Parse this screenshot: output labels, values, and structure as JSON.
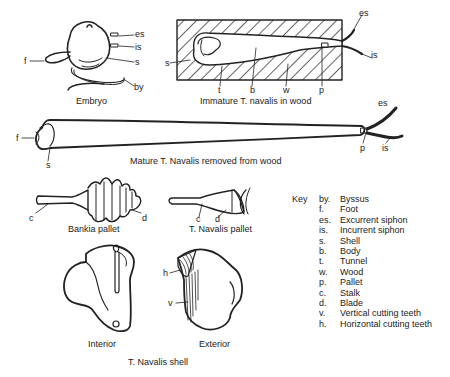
{
  "figures": {
    "embryo": {
      "caption": "Embryo",
      "labels": {
        "es": "es",
        "is": "is",
        "f": "f",
        "s": "s",
        "by": "by"
      }
    },
    "immature": {
      "caption": "Immature T. navalis in wood",
      "labels": {
        "es": "es",
        "is": "is",
        "s": "s",
        "t": "t",
        "b": "b",
        "w": "w",
        "p": "p"
      }
    },
    "mature": {
      "caption": "Mature T. Navalis removed from wood",
      "labels": {
        "es": "es",
        "f": "f",
        "s": "s",
        "p": "p",
        "is": "is"
      }
    },
    "bankia_pallet": {
      "caption": "Bankia pallet",
      "labels": {
        "c": "c",
        "d": "d"
      }
    },
    "navalis_pallet": {
      "caption": "T. Navalis pallet",
      "labels": {
        "c": "c",
        "d": "d"
      }
    },
    "shell": {
      "caption": "T. Navalis shell",
      "interior_caption": "Interior",
      "exterior_caption": "Exterior",
      "labels": {
        "h": "h",
        "v": "v"
      }
    }
  },
  "key": {
    "title": "Key",
    "items": [
      {
        "abbr": "by.",
        "meaning": "Byssus"
      },
      {
        "abbr": "f.",
        "meaning": "Foot"
      },
      {
        "abbr": "es.",
        "meaning": "Excurrent siphon"
      },
      {
        "abbr": "is.",
        "meaning": "Incurrent siphon"
      },
      {
        "abbr": "s.",
        "meaning": "Shell"
      },
      {
        "abbr": "b.",
        "meaning": "Body"
      },
      {
        "abbr": "t.",
        "meaning": "Tunnel"
      },
      {
        "abbr": "w.",
        "meaning": "Wood"
      },
      {
        "abbr": "p.",
        "meaning": "Pallet"
      },
      {
        "abbr": "c.",
        "meaning": "Stalk"
      },
      {
        "abbr": "d.",
        "meaning": "Blade"
      },
      {
        "abbr": "v.",
        "meaning": "Vertical cutting teeth"
      },
      {
        "abbr": "h.",
        "meaning": "Horizontal cutting teeth"
      }
    ]
  },
  "colors": {
    "ink": "#222222",
    "background": "#ffffff"
  }
}
